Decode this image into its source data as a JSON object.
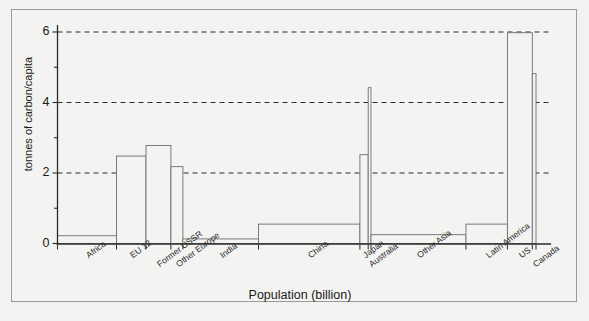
{
  "figure": {
    "background_color": "#f2f2f0",
    "frame_color": "#9a9a98",
    "line_color": "#6e6e6e",
    "axis_color": "#2b2b2b",
    "text_color": "#1a1a1a"
  },
  "chart_data": {
    "type": "bar",
    "variant": "variable-width-bar",
    "title": "",
    "xlabel": "Population (billion)",
    "ylabel": "tonnes of carbon/capita",
    "xlim": [
      0,
      5.32
    ],
    "ylim": [
      0,
      6.35
    ],
    "grid": "horizontal-dashed",
    "gridlines": [
      2,
      4,
      6
    ],
    "legend": "none",
    "yticks_major": [
      0,
      2,
      4,
      6
    ],
    "yticks_minor": [
      1,
      3,
      5
    ],
    "ytick_labels": [
      "0",
      "2",
      "4",
      "6"
    ],
    "categories": [
      "Africa",
      "EU 12",
      "Former USSR",
      "Other Europe",
      "India",
      "China",
      "Japan",
      "Australia",
      "Other Asia",
      "Latin America",
      "US",
      "Canada"
    ],
    "values": [
      0.22,
      2.48,
      2.78,
      2.18,
      0.13,
      0.55,
      2.52,
      4.42,
      0.25,
      0.55,
      5.98,
      4.82
    ],
    "widths": [
      0.64,
      0.32,
      0.27,
      0.13,
      0.82,
      1.1,
      0.09,
      0.03,
      1.03,
      0.45,
      0.27,
      0.04
    ],
    "units": {
      "x": "billion people",
      "y": "tonnes of carbon per capita"
    },
    "bars": [
      {
        "label": "Africa",
        "value": 0.22,
        "x_start": 0.0,
        "x_end": 0.64
      },
      {
        "label": "EU 12",
        "value": 2.48,
        "x_start": 0.64,
        "x_end": 0.96
      },
      {
        "label": "Former USSR",
        "value": 2.78,
        "x_start": 0.96,
        "x_end": 1.23
      },
      {
        "label": "Other Europe",
        "value": 2.18,
        "x_start": 1.23,
        "x_end": 1.36
      },
      {
        "label": "India",
        "value": 0.13,
        "x_start": 1.36,
        "x_end": 2.18
      },
      {
        "label": "China",
        "value": 0.55,
        "x_start": 2.18,
        "x_end": 3.28
      },
      {
        "label": "Japan",
        "value": 2.52,
        "x_start": 3.28,
        "x_end": 3.37
      },
      {
        "label": "Australia",
        "value": 4.42,
        "x_start": 3.37,
        "x_end": 3.4
      },
      {
        "label": "Other Asia",
        "value": 0.25,
        "x_start": 3.4,
        "x_end": 4.43
      },
      {
        "label": "Latin America",
        "value": 0.55,
        "x_start": 4.43,
        "x_end": 4.88
      },
      {
        "label": "US",
        "value": 5.98,
        "x_start": 4.88,
        "x_end": 5.15
      },
      {
        "label": "Canada",
        "value": 4.82,
        "x_start": 5.15,
        "x_end": 5.19
      }
    ]
  }
}
